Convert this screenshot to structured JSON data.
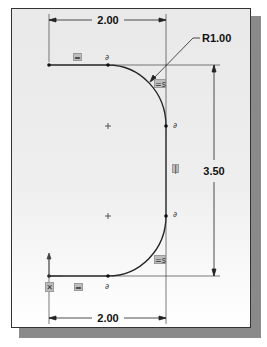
{
  "diagram": {
    "dimensions": {
      "top_width": "2.00",
      "bottom_width": "2.00",
      "height": "3.50",
      "radius": "R1.00"
    },
    "relations": {
      "top_horizontal": "═",
      "top_tangent": "∂",
      "arc_top_equal": "=s",
      "right_tangent_top": "∂",
      "right_vertical": "|",
      "right_tangent_bottom": "∂",
      "arc_bottom_equal": "=s",
      "origin_fixed": "✕",
      "bottom_horizontal": "═",
      "bottom_tangent": "∂"
    },
    "colors": {
      "line": "#222222",
      "frame_border": "#333333",
      "shadow": "#8a8a8a",
      "relation_bg": "#bdbdbd"
    }
  }
}
